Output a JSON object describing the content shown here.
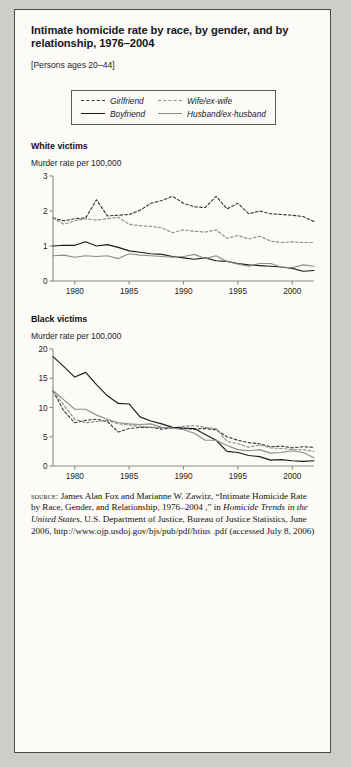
{
  "title": "Intimate homicide rate by race, by gender, and by relationship, 1976–2004",
  "subtitle": "[Persons ages 20–44]",
  "legend": {
    "items": [
      {
        "label": "Girlfriend",
        "style": "dashed",
        "color": "#3a3a3a",
        "key": "girlfriend"
      },
      {
        "label": "Wife/ex-wife",
        "style": "dashed",
        "color": "#8d8d8d",
        "key": "wife"
      },
      {
        "label": "Boyfriend",
        "style": "solid",
        "color": "#1b1b1b",
        "key": "boyfriend"
      },
      {
        "label": "Husband/ex-husband",
        "style": "solid",
        "color": "#8d8d8d",
        "key": "husband"
      }
    ]
  },
  "panels": [
    {
      "title": "White victims",
      "axis_label": "Murder rate per 100,000"
    },
    {
      "title": "Black victims",
      "axis_label": "Murder rate per 100,000"
    }
  ],
  "source": {
    "label": "source:",
    "text_1": " James Alan Fox and Marianne W. Zawitz, “Intimate Homicide Rate by Race, Gender, and Relationship, 1976–2004 ,” in ",
    "italic_1": "Homicide Trends in the United States",
    "text_2": ", U.S. Department of Justice, Bureau of Justice Statistics, June 2006, http://www.ojp.usdoj.gov/bjs/pub/pdf/htius .pdf (accessed July 8, 2006)"
  },
  "chart_data": [
    {
      "type": "line",
      "title": "White victims",
      "xlabel": "",
      "ylabel": "Murder rate per 100,000",
      "xlim": [
        1978,
        2002
      ],
      "ylim": [
        0,
        3
      ],
      "yticks": [
        0,
        1,
        2,
        3
      ],
      "xticks": [
        1980,
        1985,
        1990,
        1995,
        2000
      ],
      "grid": false,
      "legend_position": "top",
      "x": [
        1978,
        1979,
        1980,
        1981,
        1982,
        1983,
        1984,
        1985,
        1986,
        1987,
        1988,
        1989,
        1990,
        1991,
        1992,
        1993,
        1994,
        1995,
        1996,
        1997,
        1998,
        1999,
        2000,
        2001,
        2002
      ],
      "series": [
        {
          "name": "Girlfriend",
          "style": "dashed",
          "color": "#3a3a3a",
          "values": [
            1.8,
            1.72,
            1.78,
            1.8,
            2.32,
            1.86,
            1.88,
            1.9,
            2.02,
            2.22,
            2.3,
            2.42,
            2.22,
            2.12,
            2.1,
            2.42,
            2.06,
            2.22,
            1.92,
            2.0,
            1.92,
            1.9,
            1.88,
            1.84,
            1.7
          ]
        },
        {
          "name": "Wife/ex-wife",
          "style": "dashed",
          "color": "#8d8d8d",
          "values": [
            1.8,
            1.62,
            1.72,
            1.78,
            1.74,
            1.78,
            1.82,
            1.62,
            1.58,
            1.56,
            1.52,
            1.38,
            1.46,
            1.42,
            1.4,
            1.46,
            1.22,
            1.3,
            1.2,
            1.28,
            1.14,
            1.1,
            1.12,
            1.1,
            1.1
          ]
        },
        {
          "name": "Boyfriend",
          "style": "solid",
          "color": "#1b1b1b",
          "values": [
            1.0,
            1.02,
            1.02,
            1.12,
            1.0,
            1.04,
            0.96,
            0.86,
            0.82,
            0.78,
            0.76,
            0.7,
            0.66,
            0.62,
            0.66,
            0.58,
            0.56,
            0.5,
            0.46,
            0.44,
            0.42,
            0.4,
            0.36,
            0.28,
            0.3
          ]
        },
        {
          "name": "Husband/ex-husband",
          "style": "solid",
          "color": "#8d8d8d",
          "values": [
            0.72,
            0.74,
            0.68,
            0.72,
            0.7,
            0.72,
            0.64,
            0.78,
            0.74,
            0.72,
            0.7,
            0.68,
            0.7,
            0.76,
            0.64,
            0.72,
            0.56,
            0.48,
            0.42,
            0.5,
            0.5,
            0.4,
            0.38,
            0.46,
            0.42
          ]
        }
      ]
    },
    {
      "type": "line",
      "title": "Black victims",
      "xlabel": "",
      "ylabel": "Murder rate per 100,000",
      "xlim": [
        1978,
        2002
      ],
      "ylim": [
        0,
        20
      ],
      "yticks": [
        0,
        5,
        10,
        15,
        20
      ],
      "xticks": [
        1980,
        1985,
        1990,
        1995,
        2000
      ],
      "grid": false,
      "legend_position": "top",
      "x": [
        1978,
        1979,
        1980,
        1981,
        1982,
        1983,
        1984,
        1985,
        1986,
        1987,
        1988,
        1989,
        1990,
        1991,
        1992,
        1993,
        1994,
        1995,
        1996,
        1997,
        1998,
        1999,
        2000,
        2001,
        2002
      ],
      "series": [
        {
          "name": "Girlfriend",
          "style": "dashed",
          "color": "#3a3a3a",
          "values": [
            12.8,
            9.4,
            7.4,
            7.8,
            8.0,
            7.6,
            5.8,
            6.4,
            6.6,
            6.6,
            6.3,
            6.5,
            6.4,
            6.3,
            6.4,
            6.2,
            5.0,
            4.4,
            4.0,
            3.8,
            3.3,
            3.4,
            3.1,
            3.3,
            3.2
          ]
        },
        {
          "name": "Wife/ex-wife",
          "style": "dashed",
          "color": "#8d8d8d",
          "values": [
            12.8,
            10.4,
            8.0,
            7.4,
            7.6,
            7.8,
            7.2,
            7.0,
            6.8,
            6.6,
            6.6,
            6.5,
            6.8,
            6.9,
            6.6,
            6.4,
            4.2,
            3.8,
            3.2,
            3.6,
            3.1,
            3.0,
            2.8,
            2.8,
            2.5
          ]
        },
        {
          "name": "Boyfriend",
          "style": "solid",
          "color": "#1b1b1b",
          "values": [
            18.7,
            17.0,
            15.2,
            16.0,
            13.9,
            12.0,
            10.7,
            10.6,
            8.4,
            7.7,
            7.2,
            6.6,
            6.5,
            6.4,
            5.4,
            4.4,
            2.5,
            2.3,
            1.8,
            1.6,
            1.0,
            1.1,
            0.9,
            0.8,
            0.9
          ]
        },
        {
          "name": "Husband/ex-husband",
          "style": "solid",
          "color": "#8d8d8d",
          "values": [
            12.9,
            11.3,
            9.7,
            9.7,
            8.7,
            8.0,
            7.4,
            7.2,
            7.1,
            7.2,
            6.6,
            6.5,
            6.2,
            5.6,
            4.4,
            4.4,
            3.5,
            2.8,
            2.6,
            2.8,
            2.2,
            2.3,
            2.6,
            2.3,
            1.4
          ]
        }
      ]
    }
  ]
}
